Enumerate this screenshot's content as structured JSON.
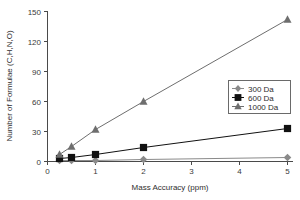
{
  "chart_data": {
    "type": "line",
    "title": "",
    "xlabel": "Mass Accuracy (ppm)",
    "ylabel": "Number of Formulae (C,H,N,O)",
    "x": [
      0.25,
      0.5,
      1,
      2,
      5
    ],
    "xlim": [
      0,
      5.4
    ],
    "ylim": [
      0,
      150
    ],
    "xticks": [
      "0",
      "1",
      "2",
      "3",
      "4",
      "5"
    ],
    "xtick_values": [
      0,
      1,
      2,
      3,
      4,
      5
    ],
    "yticks": [
      "0",
      "30",
      "60",
      "90",
      "120",
      "150"
    ],
    "ytick_values": [
      0,
      30,
      60,
      90,
      120,
      150
    ],
    "grid": false,
    "legend_position": "center-right",
    "series": [
      {
        "name": "300 Da",
        "marker": "diamond",
        "color": "#8a8a8a",
        "values": [
          1,
          1,
          1,
          2,
          4
        ]
      },
      {
        "name": "600 Da",
        "marker": "square",
        "color": "#111111",
        "values": [
          3,
          4,
          7,
          14,
          33
        ]
      },
      {
        "name": "1000 Da",
        "marker": "triangle",
        "color": "#6e6e6e",
        "values": [
          7,
          15,
          32,
          60,
          142
        ]
      }
    ]
  },
  "axes": {
    "x_title": "Mass Accuracy (ppm)",
    "y_title": "Number of Formulae (C,H,N,O)",
    "x_tick_0": "0",
    "x_tick_1": "1",
    "x_tick_2": "2",
    "x_tick_3": "3",
    "x_tick_4": "4",
    "x_tick_5": "5",
    "y_tick_0": "0",
    "y_tick_30": "30",
    "y_tick_60": "60",
    "y_tick_90": "90",
    "y_tick_120": "120",
    "y_tick_150": "150"
  },
  "legend": {
    "item_300": "300 Da",
    "item_600": "600 Da",
    "item_1000": "1000 Da"
  }
}
